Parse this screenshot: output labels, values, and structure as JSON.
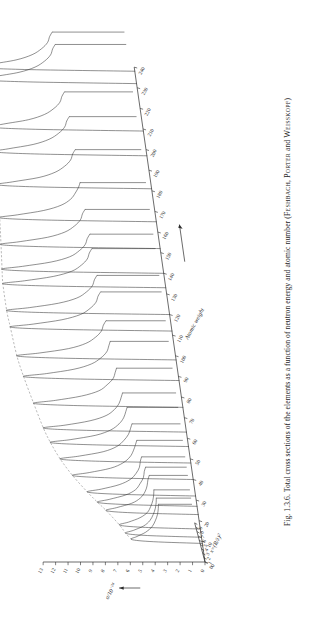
{
  "figure": {
    "number": "Fig. 1.3.6.",
    "caption_main": "Total cross sections of the elements as a function of neutron energy and atomic number",
    "authors": "(Feshbach, Porter and Weisskopf)",
    "authors_list": [
      "Feshbach",
      "Porter",
      "Weisskopf"
    ],
    "caption_full": "Fig. 1.3.6.  Total cross sections of the elements as a function of neutron energy and atomic number (Feshbach, Porter and Weisskopf)"
  },
  "running_head": "",
  "chart_data": {
    "type": "line",
    "title": "Total cross sections of the elements as a function of neutron energy and atomic number",
    "projection": "3d-waterfall",
    "xlabel": "x = (R/λ)²",
    "ylabel": "σ / 10⁻²⁴",
    "zlabel": "Atomic weight",
    "xlabel_parts": {
      "var": "x",
      "equals": "=",
      "expr": "(R/λ)",
      "exponent": "2"
    },
    "ylabel_parts": {
      "numerator": "σ",
      "denominator": "10",
      "denominator_exponent": "-24"
    },
    "xlim": [
      0,
      9
    ],
    "ylim": [
      0,
      13
    ],
    "zlim": [
      0,
      240
    ],
    "grid": false,
    "legend": false,
    "x_ticks": [
      0,
      1,
      2,
      3,
      4,
      5,
      6,
      7,
      8,
      9
    ],
    "x_ticklabels": [
      "0",
      "1",
      "2",
      "3",
      "4",
      "5",
      "6",
      "7",
      "8",
      "9"
    ],
    "y_ticks": [
      0,
      1,
      2,
      3,
      4,
      5,
      6,
      7,
      8,
      9,
      10,
      11,
      12,
      13
    ],
    "y_ticklabels": [
      "0",
      "1",
      "2",
      "3",
      "4",
      "5",
      "6",
      "7",
      "8",
      "9",
      "10",
      "11",
      "12",
      "13"
    ],
    "z_ticks": [
      0,
      10,
      20,
      30,
      40,
      50,
      60,
      70,
      80,
      90,
      100,
      110,
      120,
      130,
      140,
      150,
      160,
      170,
      180,
      190,
      200,
      210,
      220,
      230,
      240
    ],
    "z_ticklabels": [
      "0",
      "10",
      "20",
      "30",
      "40",
      "50",
      "60",
      "70",
      "80",
      "90",
      "100",
      "110",
      "120",
      "130",
      "140",
      "150",
      "160",
      "170",
      "180",
      "190",
      "200",
      "210",
      "220",
      "230",
      "240"
    ],
    "series": [
      {
        "name": "A=9",
        "z": 9,
        "x": [
          0,
          0.4,
          0.9,
          1.6,
          2.6,
          3.8,
          5.2,
          6.6,
          8.0,
          9.0
        ],
        "values": [
          0.0,
          3.9,
          5.6,
          5.1,
          4.3,
          3.7,
          3.3,
          3.0,
          2.8,
          2.7
        ]
      },
      {
        "name": "A=12",
        "z": 12,
        "x": [
          0,
          0.4,
          0.9,
          1.6,
          2.6,
          3.8,
          5.2,
          6.6,
          8.0,
          9.0
        ],
        "values": [
          0.0,
          4.3,
          6.0,
          5.3,
          4.4,
          3.8,
          3.4,
          3.1,
          2.9,
          2.8
        ]
      },
      {
        "name": "A=16",
        "z": 16,
        "x": [
          0,
          0.4,
          0.9,
          1.6,
          2.6,
          3.8,
          5.2,
          6.6,
          8.0,
          9.0
        ],
        "values": [
          0.0,
          4.6,
          6.4,
          5.6,
          4.6,
          3.9,
          3.5,
          3.2,
          3.0,
          2.9
        ]
      },
      {
        "name": "A=23",
        "z": 23,
        "x": [
          0,
          0.4,
          0.9,
          1.6,
          2.6,
          3.8,
          5.2,
          6.6,
          8.0,
          9.0
        ],
        "values": [
          0.0,
          5.2,
          7.3,
          6.4,
          5.1,
          4.3,
          3.8,
          3.5,
          3.3,
          3.1
        ]
      },
      {
        "name": "A=27",
        "z": 27,
        "x": [
          0,
          0.4,
          0.9,
          1.6,
          2.6,
          3.8,
          5.2,
          6.6,
          8.0,
          9.0
        ],
        "values": [
          0.0,
          5.6,
          7.9,
          6.9,
          5.5,
          4.6,
          4.1,
          3.7,
          3.5,
          3.3
        ]
      },
      {
        "name": "A=32",
        "z": 32,
        "x": [
          0,
          0.4,
          0.9,
          1.6,
          2.6,
          3.8,
          5.2,
          6.6,
          8.0,
          9.0
        ],
        "values": [
          0.0,
          6.1,
          8.6,
          7.4,
          5.9,
          4.9,
          4.3,
          3.9,
          3.7,
          3.5
        ]
      },
      {
        "name": "A=40",
        "z": 40,
        "x": [
          0,
          0.4,
          0.9,
          1.6,
          2.6,
          3.8,
          5.2,
          6.6,
          8.0,
          9.0
        ],
        "values": [
          0.0,
          6.8,
          9.6,
          8.2,
          6.4,
          5.3,
          4.6,
          4.2,
          3.9,
          3.7
        ]
      },
      {
        "name": "A=48",
        "z": 48,
        "x": [
          0,
          0.4,
          0.9,
          1.6,
          2.6,
          3.8,
          5.2,
          6.6,
          8.0,
          9.0
        ],
        "values": [
          0.0,
          7.3,
          10.4,
          8.8,
          6.8,
          5.6,
          4.9,
          4.4,
          4.1,
          3.9
        ]
      },
      {
        "name": "A=56",
        "z": 56,
        "x": [
          0,
          0.4,
          0.9,
          1.6,
          2.6,
          3.8,
          5.2,
          6.6,
          8.0,
          9.0
        ],
        "values": [
          0.0,
          7.7,
          11.0,
          9.3,
          7.2,
          5.9,
          5.1,
          4.6,
          4.3,
          4.1
        ]
      },
      {
        "name": "A=63",
        "z": 63,
        "x": [
          0,
          0.4,
          0.9,
          1.6,
          2.6,
          3.8,
          5.2,
          6.6,
          8.0,
          9.0
        ],
        "values": [
          0.0,
          8.0,
          11.4,
          9.6,
          7.5,
          6.1,
          5.3,
          4.8,
          4.5,
          4.3
        ]
      },
      {
        "name": "A=75",
        "z": 75,
        "x": [
          0,
          0.4,
          0.9,
          1.6,
          2.6,
          3.8,
          5.2,
          6.6,
          8.0,
          9.0
        ],
        "values": [
          0.0,
          8.4,
          11.9,
          10.1,
          7.9,
          6.4,
          5.6,
          5.0,
          4.7,
          4.5
        ]
      },
      {
        "name": "A=88",
        "z": 88,
        "x": [
          0,
          0.4,
          0.9,
          1.6,
          2.6,
          3.8,
          5.2,
          6.6,
          8.0,
          9.0
        ],
        "values": [
          0.0,
          8.8,
          12.4,
          10.5,
          8.2,
          6.7,
          5.8,
          5.2,
          4.9,
          4.7
        ]
      },
      {
        "name": "A=98",
        "z": 98,
        "x": [
          0,
          0.4,
          0.9,
          1.6,
          2.6,
          3.8,
          5.2,
          6.6,
          8.0,
          9.0
        ],
        "values": [
          0.0,
          9.0,
          12.7,
          10.8,
          8.4,
          6.9,
          6.0,
          5.4,
          5.1,
          4.8
        ]
      },
      {
        "name": "A=112",
        "z": 112,
        "x": [
          0,
          0.4,
          0.9,
          1.6,
          2.6,
          3.8,
          5.2,
          6.6,
          8.0,
          9.0
        ],
        "values": [
          0.0,
          9.2,
          12.9,
          11.0,
          8.6,
          7.0,
          6.1,
          5.5,
          5.2,
          4.9
        ]
      },
      {
        "name": "A=120",
        "z": 120,
        "x": [
          0,
          0.4,
          0.9,
          1.6,
          2.6,
          3.8,
          5.2,
          6.6,
          8.0,
          9.0
        ],
        "values": [
          0.0,
          9.3,
          13.0,
          11.1,
          8.7,
          7.1,
          6.2,
          5.6,
          5.3,
          5.0
        ]
      },
      {
        "name": "A=133",
        "z": 133,
        "x": [
          0,
          0.4,
          0.9,
          1.6,
          2.6,
          3.8,
          5.2,
          6.6,
          8.0,
          9.0
        ],
        "values": [
          0.0,
          9.3,
          13.0,
          11.2,
          8.8,
          7.2,
          6.3,
          5.7,
          5.4,
          5.1
        ]
      },
      {
        "name": "A=140",
        "z": 140,
        "x": [
          0,
          0.4,
          0.9,
          1.6,
          2.6,
          3.8,
          5.2,
          6.6,
          8.0,
          9.0
        ],
        "values": [
          0.0,
          9.2,
          12.9,
          11.2,
          8.8,
          7.2,
          6.3,
          5.7,
          5.4,
          5.1
        ]
      },
      {
        "name": "A=152",
        "z": 152,
        "x": [
          0,
          0.4,
          0.9,
          1.6,
          2.6,
          3.8,
          5.2,
          6.6,
          8.0,
          9.0
        ],
        "values": [
          0.0,
          9.0,
          12.7,
          11.1,
          8.8,
          7.3,
          6.4,
          5.8,
          5.5,
          5.2
        ]
      },
      {
        "name": "A=165",
        "z": 165,
        "x": [
          0,
          0.4,
          0.9,
          1.6,
          2.6,
          3.8,
          5.2,
          6.6,
          8.0,
          9.0
        ],
        "values": [
          0.0,
          8.8,
          12.5,
          11.0,
          8.8,
          7.3,
          6.4,
          5.9,
          5.5,
          5.3
        ]
      },
      {
        "name": "A=181",
        "z": 181,
        "x": [
          0,
          0.4,
          0.9,
          1.6,
          2.6,
          3.8,
          5.2,
          6.6,
          8.0,
          9.0
        ],
        "values": [
          0.0,
          8.7,
          12.3,
          11.0,
          8.8,
          7.4,
          6.5,
          5.9,
          5.6,
          5.3
        ]
      },
      {
        "name": "A=197",
        "z": 197,
        "x": [
          0,
          0.4,
          0.9,
          1.6,
          2.6,
          3.8,
          5.2,
          6.6,
          8.0,
          9.0
        ],
        "values": [
          0.0,
          8.6,
          12.2,
          11.0,
          8.9,
          7.5,
          6.6,
          6.0,
          5.7,
          5.4
        ]
      },
      {
        "name": "A=209",
        "z": 209,
        "x": [
          0,
          0.4,
          0.9,
          1.6,
          2.6,
          3.8,
          5.2,
          6.6,
          8.0,
          9.0
        ],
        "values": [
          0.0,
          8.6,
          12.2,
          11.1,
          9.0,
          7.6,
          6.7,
          6.1,
          5.8,
          5.5
        ]
      },
      {
        "name": "A=232",
        "z": 232,
        "x": [
          0,
          0.4,
          0.9,
          1.6,
          2.6,
          3.8,
          5.2,
          6.6,
          8.0,
          9.0
        ],
        "values": [
          0.0,
          8.7,
          12.4,
          11.3,
          9.2,
          7.8,
          6.9,
          6.3,
          6.0,
          5.7
        ]
      },
      {
        "name": "A=238",
        "z": 238,
        "x": [
          0,
          0.4,
          0.9,
          1.6,
          2.6,
          3.8,
          5.2,
          6.6,
          8.0,
          9.0
        ],
        "values": [
          0.0,
          8.8,
          12.5,
          11.4,
          9.3,
          7.9,
          7.0,
          6.4,
          6.1,
          5.8
        ]
      }
    ],
    "ridge_annotation": "diagonal ridge line tracing the giant resonance maxima across atomic weight"
  }
}
